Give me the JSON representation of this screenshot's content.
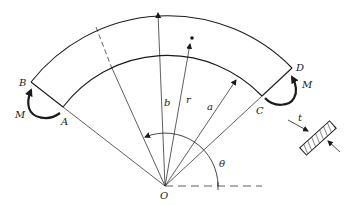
{
  "diagram": {
    "colors": {
      "stroke": "#1a1a1a",
      "background": "#ffffff"
    },
    "points": {
      "B": "B",
      "A": "A",
      "C": "C",
      "D": "D",
      "O": "O"
    },
    "dimensions": {
      "outer_radius": "b",
      "inner_radius": "a",
      "general_radius": "r",
      "angle": "θ",
      "thickness": "t"
    },
    "moments": {
      "left": "M",
      "right": "M"
    }
  }
}
